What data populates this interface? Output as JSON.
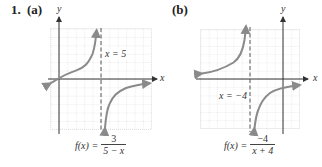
{
  "problem": {
    "number": "1.",
    "parts": [
      {
        "label": "(a)",
        "y_axis_label": "y",
        "x_axis_label": "x",
        "asymptote_label": "x = 5",
        "formula_lhs": "f(x) =",
        "formula_num": "3",
        "formula_den": "5 − x"
      },
      {
        "label": "(b)",
        "y_axis_label": "y",
        "x_axis_label": "x",
        "asymptote_label": "x = −4",
        "formula_lhs": "f(x) =",
        "formula_num": "−4",
        "formula_den": "x + 4"
      }
    ]
  },
  "colors": {
    "grid": "#c8c8c8",
    "axis": "#333333",
    "curve": "#8a8a8a",
    "asymptote": "#555555"
  }
}
